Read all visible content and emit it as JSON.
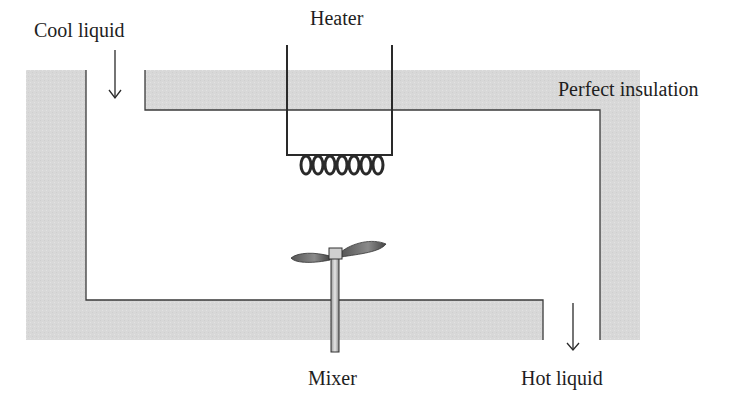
{
  "diagram": {
    "labels": {
      "inlet": "Cool liquid",
      "heater": "Heater",
      "insulation": "Perfect insulation",
      "mixer": "Mixer",
      "outlet": "Hot liquid"
    },
    "colors": {
      "insulation_fill": "#d9d9d9",
      "line": "#2a2a2a",
      "text": "#1e1e1e",
      "background": "#ffffff"
    },
    "components": [
      {
        "id": "inlet-arrow",
        "semantic": "down-arrow-icon"
      },
      {
        "id": "outlet-arrow",
        "semantic": "down-arrow-icon"
      },
      {
        "id": "heater-coil",
        "semantic": "coil-icon",
        "turns": 7
      },
      {
        "id": "mixer-impeller",
        "semantic": "propeller-icon"
      }
    ]
  }
}
